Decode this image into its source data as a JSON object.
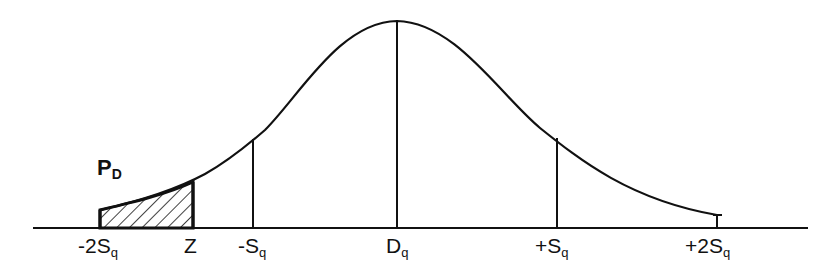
{
  "diagram": {
    "type": "normal-distribution-curve",
    "shaded_region_label": {
      "main": "P",
      "sub": "D"
    },
    "axis_labels": [
      {
        "id": "minus-2sq",
        "main": "-2S",
        "sub": "q",
        "x": 100
      },
      {
        "id": "z",
        "main": "Z",
        "sub": "",
        "x": 193
      },
      {
        "id": "minus-sq",
        "main": "-S",
        "sub": "q",
        "x": 253
      },
      {
        "id": "dq",
        "main": "D",
        "sub": "q",
        "x": 397
      },
      {
        "id": "plus-sq",
        "main": "+S",
        "sub": "q",
        "x": 557
      },
      {
        "id": "plus-2sq",
        "main": "+2S",
        "sub": "q",
        "x": 717
      }
    ],
    "colors": {
      "line": "#111111",
      "background": "#ffffff"
    }
  }
}
